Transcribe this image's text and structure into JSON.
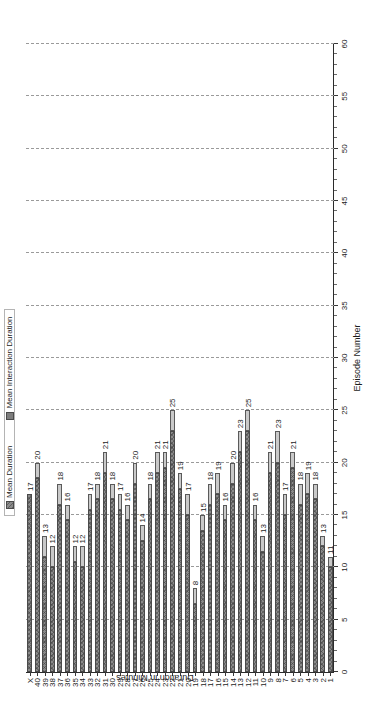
{
  "chart_data": {
    "type": "bar",
    "orientation": "horizontal",
    "stacked": true,
    "title": "",
    "xlabel": "Episode Number",
    "ylabel": "Duration in Minutes",
    "ylim": [
      0,
      60
    ],
    "ytick_step": 5,
    "grid": true,
    "grid_style": "dashed",
    "legend_position": "top",
    "categories": [
      "1",
      "2",
      "3",
      "4",
      "5",
      "6",
      "7",
      "8",
      "9",
      "10",
      "11",
      "12",
      "13",
      "14",
      "15",
      "16",
      "17",
      "18",
      "19",
      "20",
      "21",
      "22",
      "23",
      "24",
      "25",
      "26",
      "27",
      "28",
      "29",
      "30",
      "31",
      "32",
      "33",
      "34",
      "35",
      "36",
      "37",
      "38",
      "39",
      "40",
      "X"
    ],
    "tick_labels": [
      "0",
      "5",
      "10",
      "15",
      "20",
      "25",
      "30",
      "35",
      "40",
      "45",
      "50",
      "55",
      "60"
    ],
    "series": [
      {
        "name": "Mean Duration",
        "values": [
          10.0,
          12.0,
          16.5,
          17.0,
          16.0,
          19.5,
          15.0,
          20.0,
          19.0,
          11.5,
          14.5,
          23.0,
          21.0,
          18.0,
          14.5,
          17.0,
          16.0,
          13.5,
          6.5,
          15.0,
          17.5,
          23.0,
          19.5,
          19.0,
          16.5,
          12.5,
          18.0,
          14.5,
          15.5,
          16.5,
          19.0,
          16.5,
          15.5,
          10.0,
          10.5,
          14.5,
          16.0,
          10.0,
          11.0,
          18.5,
          17.0
        ]
      },
      {
        "name": "Mean Interaction Duration",
        "values": [
          1.0,
          1.0,
          1.5,
          2.0,
          2.0,
          1.5,
          2.0,
          3.0,
          2.0,
          1.5,
          1.5,
          2.0,
          2.0,
          2.0,
          1.5,
          2.0,
          2.0,
          1.5,
          1.5,
          2.0,
          1.5,
          2.0,
          1.5,
          2.0,
          1.5,
          1.5,
          2.0,
          1.5,
          1.5,
          1.5,
          2.0,
          1.5,
          1.5,
          2.0,
          1.5,
          1.5,
          2.0,
          2.0,
          2.0,
          1.5,
          0.0
        ]
      }
    ],
    "totals": [
      11,
      13,
      18,
      19,
      18,
      21,
      17,
      23,
      21,
      13,
      16,
      25,
      23,
      20,
      16,
      19,
      18,
      15,
      8,
      17,
      19,
      25,
      21,
      21,
      18,
      14,
      20,
      16,
      17,
      18,
      21,
      18,
      17,
      12,
      12,
      16,
      18,
      12,
      13,
      20,
      17
    ],
    "bar_labels": [
      "11",
      "13",
      "18",
      "19",
      "18",
      "21",
      "17",
      "23",
      "21",
      "13",
      "16",
      "25",
      "23",
      "20",
      "16",
      "19",
      "18",
      "15",
      "8",
      "17",
      "19",
      "25",
      "21",
      "21",
      "18",
      "14",
      "20",
      "16",
      "17",
      "18",
      "21",
      "18",
      "17",
      "12",
      "12",
      "16",
      "18",
      "12",
      "13",
      "20",
      "17"
    ]
  },
  "legend": {
    "items": [
      {
        "label": "Mean Duration",
        "swatch": "main"
      },
      {
        "label": "Mean Interaction Duration",
        "swatch": "inter"
      }
    ]
  },
  "axes": {
    "value_axis_title": "Duration in Minutes",
    "category_axis_title": "Episode Number"
  },
  "colors": {
    "bar_main": "#8a8a8a",
    "bar_interaction": "#c9c9c9",
    "grid": "#9a9a9a",
    "axis": "#2b2b2b",
    "text": "#1c1c1c",
    "background": "#ffffff"
  }
}
